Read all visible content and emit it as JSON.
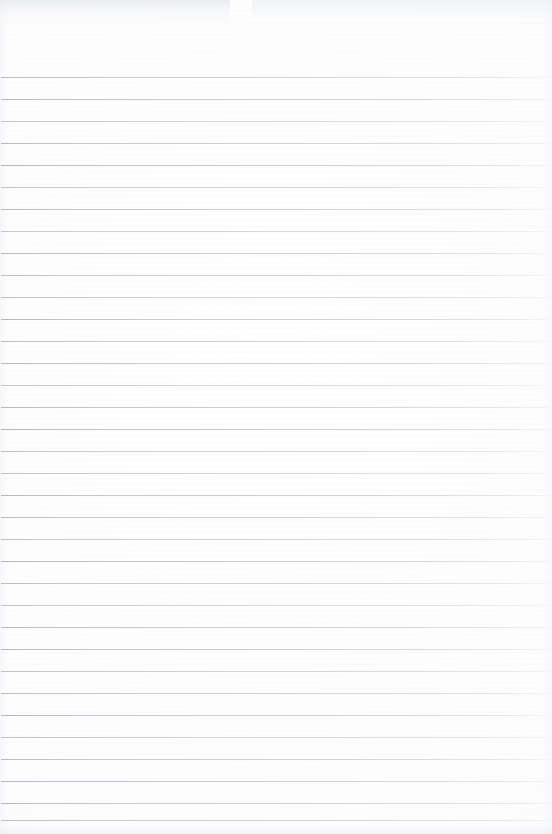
{
  "document": {
    "kind": "blank-ruled-notepad-page",
    "title": "Blank Ruled Notepad Page",
    "content_text": "",
    "has_handwriting": false,
    "has_printed_text": false,
    "has_margin_rule": false
  },
  "page": {
    "width": 552,
    "height": 834,
    "background_color": "#fdfdfd",
    "paper_tint": "#fbfbfc"
  },
  "ruling": {
    "line_color": "#b8bcc2",
    "line_color_left": "#a8adb4",
    "line_color_right": "#ced2d8",
    "line_thickness": 1,
    "line_spacing": 22,
    "first_line_y": 77,
    "last_line_y": 820,
    "line_count": 35,
    "line_start_x": 1,
    "line_end_x": 549,
    "top_margin": 77,
    "bottom_margin": 14,
    "line_y_positions": [
      77,
      99,
      121,
      143,
      165,
      187,
      209,
      231,
      253,
      275,
      297,
      319,
      341,
      363,
      385,
      407,
      429,
      451,
      473,
      495,
      517,
      539,
      561,
      583,
      605,
      627,
      649,
      671,
      693,
      715,
      737,
      759,
      781,
      803,
      820
    ],
    "line_opacities": [
      0.85,
      0.92,
      0.78,
      0.88,
      0.95,
      0.82,
      0.9,
      0.75,
      0.93,
      0.86,
      0.8,
      0.94,
      0.83,
      0.89,
      0.77,
      0.91,
      0.96,
      0.84,
      0.79,
      0.92,
      0.87,
      0.81,
      0.95,
      0.88,
      0.76,
      0.9,
      0.93,
      0.82,
      0.86,
      0.94,
      0.8,
      0.89,
      0.97,
      0.91,
      0.85
    ]
  },
  "artifacts": {
    "top_left_smudge": true,
    "top_right_smudge": true,
    "bottom_edge_band": true,
    "scan_streaks": true
  }
}
